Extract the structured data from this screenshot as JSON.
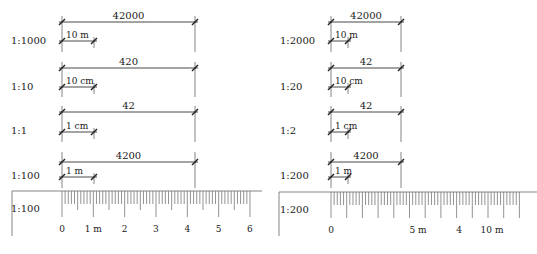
{
  "panels": [
    {
      "name": "left",
      "origin_x": 62,
      "end_x": 195,
      "rows": [
        {
          "scale_label": "1:1000",
          "label_y": 44,
          "dim_y": 22,
          "dim_value": "42000",
          "sub_y": 41,
          "sub_end_x": 94,
          "sub_label": "10 m",
          "top_y": 16,
          "bottom_y": 52
        },
        {
          "scale_label": "1:10",
          "label_y": 90,
          "dim_y": 68,
          "dim_value": "420",
          "sub_y": 87,
          "sub_end_x": 94,
          "sub_label": "10 cm",
          "top_y": 62,
          "bottom_y": 97
        },
        {
          "scale_label": "1:1",
          "label_y": 134,
          "dim_y": 112,
          "dim_value": "42",
          "sub_y": 132,
          "sub_end_x": 94,
          "sub_label": "1 cm",
          "top_y": 106,
          "bottom_y": 142
        },
        {
          "scale_label": "1:100",
          "label_y": 179,
          "dim_y": 162,
          "dim_value": "4200",
          "sub_y": 177,
          "sub_end_x": 94,
          "sub_label": "1 m",
          "top_y": 152,
          "bottom_y": 188
        }
      ],
      "ruler": {
        "scale_label": "1:100",
        "frame_left": 12,
        "frame_right": 262,
        "top_y": 191,
        "frame_bottom_y": 236,
        "start_x": 62,
        "unit_px": 31.33,
        "units": 6,
        "minor_per_unit": 10,
        "tick_labels": [
          "0",
          "1 m",
          "2",
          "3",
          "4",
          "5",
          "6"
        ],
        "tick_label_y": 232
      }
    },
    {
      "name": "right",
      "origin_x": 331,
      "end_x": 401,
      "rows": [
        {
          "scale_label": "1:2000",
          "label_y": 44,
          "dim_y": 22,
          "dim_value": "42000",
          "sub_y": 41,
          "sub_end_x": 348,
          "sub_label": "10 m",
          "top_y": 16,
          "bottom_y": 52
        },
        {
          "scale_label": "1:20",
          "label_y": 90,
          "dim_y": 68,
          "dim_value": "42",
          "sub_y": 87,
          "sub_end_x": 348,
          "sub_label": "10 cm",
          "top_y": 62,
          "bottom_y": 97
        },
        {
          "scale_label": "1:2",
          "label_y": 134,
          "dim_y": 112,
          "dim_value": "42",
          "sub_y": 132,
          "sub_end_x": 348,
          "sub_label": "1 cm",
          "top_y": 106,
          "bottom_y": 142
        },
        {
          "scale_label": "1:200",
          "label_y": 179,
          "dim_y": 162,
          "dim_value": "4200",
          "sub_y": 177,
          "sub_end_x": 348,
          "sub_label": "1 m",
          "top_y": 152,
          "bottom_y": 188
        }
      ],
      "ruler": {
        "scale_label": "1:200",
        "frame_left": 279,
        "frame_right": 537,
        "top_y": 192,
        "frame_bottom_y": 236,
        "start_x": 331,
        "unit_px": 15.7,
        "units": 12,
        "minor_per_unit": 5,
        "tick_labels": [
          {
            "text": "0",
            "x": 331
          },
          {
            "text": "5 m",
            "x": 418
          },
          {
            "text": "4",
            "x": 459
          },
          {
            "text": "10 m",
            "x": 492
          }
        ],
        "tick_label_y": 233
      }
    }
  ]
}
